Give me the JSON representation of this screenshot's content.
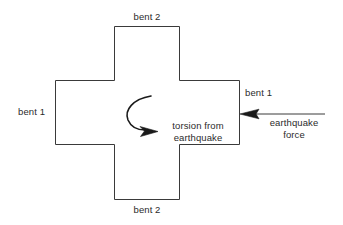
{
  "diagram": {
    "type": "plan-schematic",
    "stroke_color": "#3a3a3a",
    "text_color": "#2b2b2b",
    "background_color": "#ffffff",
    "labels": {
      "bent2_top": "bent 2",
      "bent2_bottom": "bent 2",
      "bent1_left": "bent 1",
      "bent1_right": "bent 1",
      "torsion": "torsion from\nearthquake",
      "earthquake_force": "earthquake\nforce"
    },
    "shapes": {
      "horizontal_wing": {
        "x": 55,
        "y": 80,
        "width": 185,
        "height": 65
      },
      "vertical_wing": {
        "x": 114,
        "y": 26,
        "width": 65,
        "height": 174
      }
    },
    "arrows": {
      "earthquake_force": {
        "from_x": 325,
        "from_y": 114,
        "to_x": 240,
        "to_y": 114,
        "direction": "left"
      },
      "torsion_moment": {
        "start_x": 151,
        "start_y": 96,
        "end_x": 157,
        "end_y": 131,
        "rotation": "counterclockwise-sweep"
      }
    }
  }
}
